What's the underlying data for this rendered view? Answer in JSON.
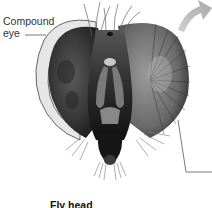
{
  "diagram": {
    "title": "Fly head",
    "labels": [
      {
        "id": "compound-eye",
        "text_line1": "Compound",
        "text_line2": "eye"
      }
    ],
    "colors": {
      "background": "#ffffff",
      "eye_left": "#3a3a3a",
      "eye_right": "#6a6a6a",
      "face": "#2a2a2a",
      "arrow": "#b8b8b8",
      "leader_line": "#555555"
    }
  }
}
